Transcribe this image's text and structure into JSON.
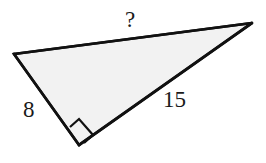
{
  "figure": {
    "kind": "right-triangle-diagram",
    "background_color": "#ffffff",
    "fill_color": "#f2f2f2",
    "stroke_color": "#111111",
    "stroke_width": 2.5,
    "vertices": {
      "left": [
        14,
        54
      ],
      "top_right": [
        252,
        23
      ],
      "bottom": [
        79,
        145
      ]
    },
    "right_angle": {
      "at_vertex": "bottom",
      "marker": "square",
      "marker_points": "79,145 70,127 79,119 93,135"
    },
    "labels": {
      "hypotenuse": "?",
      "leg_a": "8",
      "leg_b": "15"
    },
    "label_names": {
      "hypotenuse": "unknown-side-label",
      "leg_a": "leg-length-label-8",
      "leg_b": "leg-length-label-15"
    }
  }
}
